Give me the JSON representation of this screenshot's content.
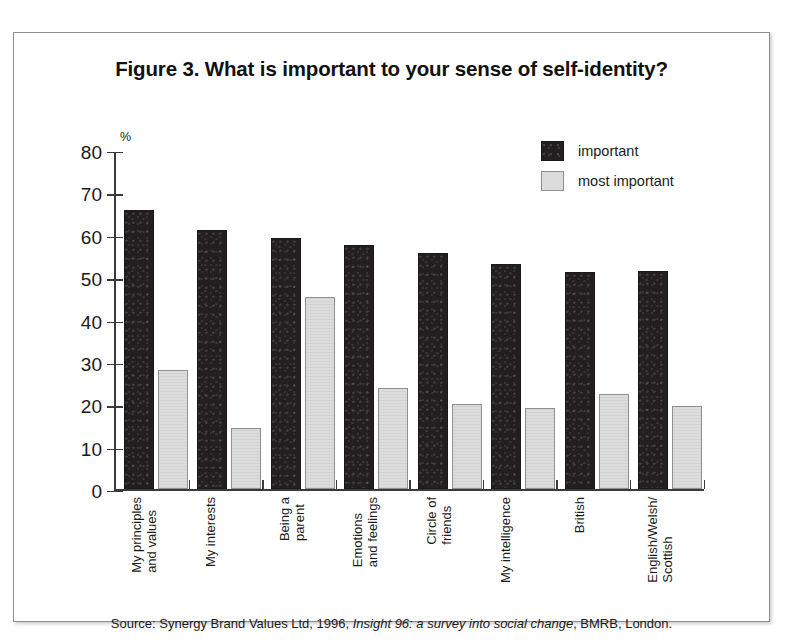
{
  "figure": {
    "title": "Figure 3. What is important to your sense of self-identity?",
    "source_prefix": "Source: Synergy Brand Values Ltd, 1996, ",
    "source_italic": "Insight 96: a survey into social change",
    "source_suffix": ", BMRB, London."
  },
  "legend": {
    "position": "top-center-right",
    "entries": [
      {
        "label": "important",
        "color": "#231f20"
      },
      {
        "label": "most important",
        "color": "#dcdcdc"
      }
    ]
  },
  "axis": {
    "unit_label": "%",
    "y_ticks": [
      "80",
      "70",
      "60",
      "50",
      "40",
      "30",
      "20",
      "10",
      "0"
    ]
  },
  "chart_data": {
    "type": "bar",
    "title": "Figure 3. What is important to your sense of self-identity?",
    "xlabel": "",
    "ylabel": "%",
    "ylim": [
      0,
      80
    ],
    "ytick_step": 10,
    "grid": false,
    "legend_position": "top-right",
    "categories": [
      "My principles\nand values",
      "My interests",
      "Being a\nparent",
      "Emotions\nand feelings",
      "Circle of\nfriends",
      "My intelligence",
      "British",
      "English/Welsh/\nScottish"
    ],
    "series": [
      {
        "name": "important",
        "color": "#231f20",
        "values": [
          66.2,
          61.4,
          59.7,
          57.9,
          56.0,
          53.4,
          51.5,
          51.8
        ]
      },
      {
        "name": "most important",
        "color": "#dcdcdc",
        "values": [
          28.3,
          14.5,
          45.7,
          24.0,
          20.2,
          19.4,
          22.6,
          19.8
        ]
      }
    ]
  }
}
